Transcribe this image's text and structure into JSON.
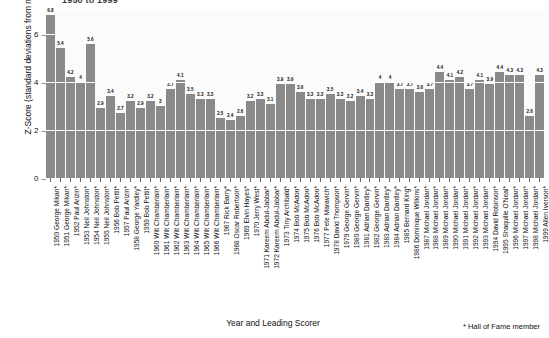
{
  "chart_data": {
    "type": "bar",
    "title": "1950 to 1999",
    "xlabel": "Year and Leading Scorer",
    "ylabel": "Z-Score (standard deviations from mean)",
    "ylim": [
      0,
      7
    ],
    "yticks": [
      0,
      2,
      4,
      6
    ],
    "grid": true,
    "legend": null,
    "bar_color": "#8a8a8a",
    "footnote": "* Hall of Fame member",
    "categories": [
      "1950 George Mikan*",
      "1951 George Mikan*",
      "1952 Paul Arizin*",
      "1953 Neil Johnston*",
      "1954 Neil Johnston*",
      "1955 Neil Johnston*",
      "1956 Bob Pettit*",
      "1957 Paul Arizin*",
      "1958 George Yardley*",
      "1959 Bob Pettit*",
      "1960 Wilt Chamberlain*",
      "1961 Wilt Chamberlain*",
      "1962 Wilt Chamberlain*",
      "1963 Wilt Chamberlain*",
      "1964 Wilt Chamberlain*",
      "1965 Wilt Chamberlain*",
      "1966 Wilt Chamberlain*",
      "1967 Rick Barry*",
      "1968 Oscar Robertson*",
      "1969 Elvin Hayes*",
      "1970 Jerry West*",
      "1971 Kareem Abdul-Jabbar*",
      "1972 Kareem Abdul-Jabbar*",
      "1973 Tiny Archibald*",
      "1974 Bob McAdoo*",
      "1975 Bob McAdoo*",
      "1976 Bob McAdoo*",
      "1977 Pete Maravich*",
      "1978 David Thompson*",
      "1979 George Gervin*",
      "1980 George Gervin*",
      "1981 Adrian Dantley*",
      "1982 George Gervin*",
      "1983 Adrian Dantley*",
      "1984 Adrian Dantley*",
      "1985 Bernard King*",
      "1986 Dominique Wilkins*",
      "1987 Michael Jordan*",
      "1988 Michael Jordan*",
      "1989 Michael Jordan*",
      "1990 Michael Jordan*",
      "1991 Michael Jordan*",
      "1992 Michael Jordan*",
      "1993 Michael Jordan*",
      "1994 David Robinson*",
      "1995 Shaquille O'Neal*",
      "1996 Michael Jordan*",
      "1997 Michael Jordan*",
      "1998 Michael Jordan*",
      "1999 Allen Iverson*"
    ],
    "values": [
      6.8,
      5.4,
      4.2,
      4.0,
      5.6,
      2.9,
      3.4,
      2.7,
      3.2,
      2.9,
      3.2,
      3.0,
      3.7,
      4.1,
      3.5,
      3.3,
      3.3,
      2.5,
      2.4,
      2.6,
      3.2,
      3.3,
      3.1,
      3.9,
      3.9,
      3.6,
      3.3,
      3.3,
      3.5,
      3.3,
      3.2,
      3.4,
      3.3,
      4.0,
      4.0,
      3.7,
      3.7,
      3.6,
      3.7,
      4.4,
      4.1,
      4.2,
      3.7,
      4.1,
      3.9,
      4.4,
      4.3,
      4.3,
      2.6,
      4.3
    ],
    "value_labels": [
      "6.8",
      "5.4",
      "4.2",
      "4",
      "5.6",
      "2.9",
      "3.4",
      "2.7",
      "3.2",
      "2.9",
      "3.2",
      "3",
      "3.7",
      "4.1",
      "3.5",
      "3.3",
      "3.3",
      "2.5",
      "2.4",
      "2.6",
      "3.2",
      "3.3",
      "3.1",
      "3.9",
      "3.9",
      "3.6",
      "3.3",
      "3.3",
      "3.5",
      "3.3",
      "3.2",
      "3.4",
      "3.3",
      "4",
      "4",
      "3.7",
      "3.7",
      "3.6",
      "3.7",
      "4.4",
      "4.1",
      "4.2",
      "3.7",
      "4.1",
      "3.9",
      "4.4",
      "4.3",
      "4.3",
      "2.6",
      "4.3"
    ]
  }
}
